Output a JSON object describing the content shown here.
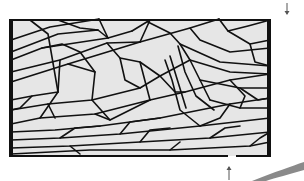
{
  "figure": {
    "colors": {
      "background": "#ffffff",
      "specimen_fill": "#e6e6e6",
      "crack_line": "#111111",
      "frame_edge": "#111111",
      "arrow": "#555555",
      "swoosh": "#8a8a8a"
    },
    "frame": {
      "x": 9,
      "y": 20,
      "width": 262,
      "height": 136,
      "left_edge_width": 4,
      "right_edge_width": 4,
      "top_edge_width": 2,
      "bottom_edge_width": 2,
      "bottom_gap": {
        "x_start": 228,
        "x_end": 236
      }
    },
    "arrows": [
      {
        "name": "load-arrow-top-right",
        "direction": "down",
        "x": 287,
        "y_start": 3,
        "y_end": 15
      },
      {
        "name": "load-arrow-bottom",
        "direction": "up",
        "x": 229,
        "y_start": 180,
        "y_end": 166
      }
    ],
    "cracks": [
      "11,40 50,27 99,19",
      "11,52 58,34 98,30 108,38",
      "11,60 42,48 108,38 132,31",
      "11,72 60,60 107,43 140,42",
      "11,82 68,64 140,42 190,28 219,19",
      "11,100 32,96 58,92",
      "11,110 48,104 92,100 140,88 160,76 190,60",
      "11,124 40,118 95,114 150,100 185,92 230,80 270,74",
      "11,132 55,130 100,126 160,118 230,104 270,98",
      "11,140 60,138 120,134 200,126 270,118",
      "11,148 70,146 140,142 210,138 270,132",
      "11,154 90,150 170,150 250,146 270,142",
      "30,20 48,34 58,92 40,118",
      "58,20 80,28 98,30",
      "99,19 108,38",
      "132,31 150,20",
      "140,42 150,20",
      "148,22 170,33 180,44 190,60 200,80 210,100",
      "219,19 228,31 248,26 270,20",
      "228,31 250,44 270,40",
      "190,28 200,40 230,52 270,48",
      "180,44 220,62 270,66",
      "190,60 230,72 270,74",
      "200,80 240,88 270,88",
      "68,64 95,72 92,100",
      "92,100 110,120",
      "42,48 62,44 80,52 95,72",
      "107,43 120,58 140,62 160,76",
      "140,62 150,100",
      "160,76 175,92 185,92",
      "170,56 178,82 186,108",
      "165,60 172,80 180,110 200,126",
      "178,46 185,72 196,96 214,110",
      "210,100 240,108 270,108",
      "230,80 245,96 240,108",
      "95,114 110,120 150,100",
      "120,134 130,122 160,118",
      "200,126 220,118 230,104",
      "60,138 75,128 100,126",
      "140,142 150,130 170,128",
      "210,138 225,128 240,126",
      "32,96 20,108 11,110",
      "48,104 55,118",
      "70,146 80,154",
      "170,150 180,142",
      "250,146 260,138 270,132",
      "60,60 58,92",
      "120,58 125,80 140,88",
      "250,44 255,62 270,66",
      "240,88 258,100 270,98"
    ]
  }
}
